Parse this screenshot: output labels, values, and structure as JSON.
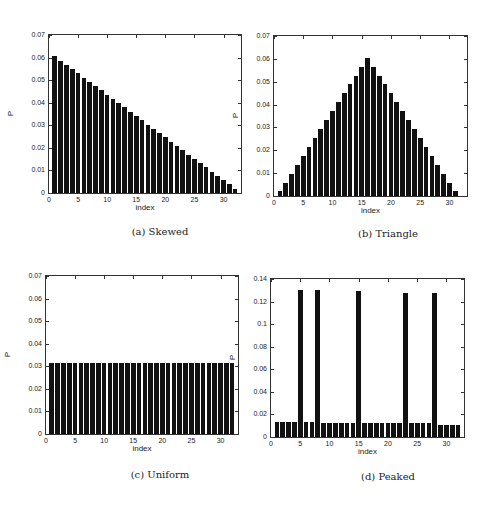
{
  "chart_data": [
    {
      "type": "bar",
      "id": "a",
      "caption": "(a) Skewed",
      "xlabel": "index",
      "ylabel": "P",
      "xlim": [
        0,
        33
      ],
      "ylim": [
        0,
        0.07
      ],
      "xticks": [
        0,
        5,
        10,
        15,
        20,
        25,
        30
      ],
      "yticks": [
        0,
        0.01,
        0.02,
        0.03,
        0.04,
        0.05,
        0.06,
        0.07
      ],
      "ytick_labels": [
        "0",
        "0.01",
        "0.02",
        "0.03",
        "0.04",
        "0.05",
        "0.06",
        "0.07"
      ],
      "categories": [
        1,
        2,
        3,
        4,
        5,
        6,
        7,
        8,
        9,
        10,
        11,
        12,
        13,
        14,
        15,
        16,
        17,
        18,
        19,
        20,
        21,
        22,
        23,
        24,
        25,
        26,
        27,
        28,
        29,
        30,
        31,
        32
      ],
      "values": [
        0.0606,
        0.0587,
        0.0568,
        0.0549,
        0.053,
        0.0511,
        0.0492,
        0.0473,
        0.0455,
        0.0436,
        0.0417,
        0.0398,
        0.0379,
        0.036,
        0.0341,
        0.0322,
        0.0303,
        0.0284,
        0.0265,
        0.0246,
        0.0227,
        0.0208,
        0.0189,
        0.017,
        0.0152,
        0.0133,
        0.0114,
        0.0095,
        0.0076,
        0.0057,
        0.0038,
        0.0019
      ],
      "grid": false
    },
    {
      "type": "bar",
      "id": "b",
      "caption": "(b) Triangle",
      "xlabel": "index",
      "ylabel": "P",
      "xlim": [
        0,
        33
      ],
      "ylim": [
        0,
        0.07
      ],
      "xticks": [
        0,
        5,
        10,
        15,
        20,
        25,
        30
      ],
      "yticks": [
        0,
        0.01,
        0.02,
        0.03,
        0.04,
        0.05,
        0.06,
        0.07
      ],
      "ytick_labels": [
        "0",
        "0.01",
        "0.02",
        "0.03",
        "0.04",
        "0.05",
        "0.06",
        "0.07"
      ],
      "categories": [
        1,
        2,
        3,
        4,
        5,
        6,
        7,
        8,
        9,
        10,
        11,
        12,
        13,
        14,
        15,
        16,
        17,
        18,
        19,
        20,
        21,
        22,
        23,
        24,
        25,
        26,
        27,
        28,
        29,
        30,
        31
      ],
      "values": [
        0.002,
        0.0059,
        0.0098,
        0.0137,
        0.0176,
        0.0215,
        0.0254,
        0.0293,
        0.0332,
        0.0371,
        0.041,
        0.0449,
        0.0488,
        0.0527,
        0.0566,
        0.0605,
        0.0566,
        0.0527,
        0.0488,
        0.0449,
        0.041,
        0.0371,
        0.0332,
        0.0293,
        0.0254,
        0.0215,
        0.0176,
        0.0137,
        0.0098,
        0.0059,
        0.002
      ],
      "grid": false
    },
    {
      "type": "bar",
      "id": "c",
      "caption": "(c) Uniform",
      "xlabel": "index",
      "ylabel": "P",
      "xlim": [
        0,
        33
      ],
      "ylim": [
        0,
        0.07
      ],
      "xticks": [
        0,
        5,
        10,
        15,
        20,
        25,
        30
      ],
      "yticks": [
        0,
        0.01,
        0.02,
        0.03,
        0.04,
        0.05,
        0.06,
        0.07
      ],
      "ytick_labels": [
        "0",
        "0.01",
        "0.02",
        "0.03",
        "0.04",
        "0.05",
        "0.06",
        "0.07"
      ],
      "categories": [
        1,
        2,
        3,
        4,
        5,
        6,
        7,
        8,
        9,
        10,
        11,
        12,
        13,
        14,
        15,
        16,
        17,
        18,
        19,
        20,
        21,
        22,
        23,
        24,
        25,
        26,
        27,
        28,
        29,
        30,
        31,
        32
      ],
      "values": [
        0.03125,
        0.03125,
        0.03125,
        0.03125,
        0.03125,
        0.03125,
        0.03125,
        0.03125,
        0.03125,
        0.03125,
        0.03125,
        0.03125,
        0.03125,
        0.03125,
        0.03125,
        0.03125,
        0.03125,
        0.03125,
        0.03125,
        0.03125,
        0.03125,
        0.03125,
        0.03125,
        0.03125,
        0.03125,
        0.03125,
        0.03125,
        0.03125,
        0.03125,
        0.03125,
        0.03125,
        0.03125
      ],
      "grid": false
    },
    {
      "type": "bar",
      "id": "d",
      "caption": "(d) Peaked",
      "xlabel": "index",
      "ylabel": "P",
      "xlim": [
        0,
        33
      ],
      "ylim": [
        0,
        0.14
      ],
      "xticks": [
        0,
        5,
        10,
        15,
        20,
        25,
        30
      ],
      "yticks": [
        0,
        0.02,
        0.04,
        0.06,
        0.08,
        0.1,
        0.12,
        0.14
      ],
      "ytick_labels": [
        "0",
        "0.02",
        "0.04",
        "0.06",
        "0.08",
        "0.1",
        "0.12",
        "0.14"
      ],
      "categories": [
        1,
        2,
        3,
        4,
        5,
        6,
        7,
        8,
        9,
        10,
        11,
        12,
        13,
        14,
        15,
        16,
        17,
        18,
        19,
        20,
        21,
        22,
        23,
        24,
        25,
        26,
        27,
        28,
        29,
        30,
        31,
        32
      ],
      "values": [
        0.013,
        0.013,
        0.013,
        0.013,
        0.13,
        0.013,
        0.013,
        0.13,
        0.012,
        0.012,
        0.012,
        0.012,
        0.012,
        0.012,
        0.129,
        0.012,
        0.012,
        0.012,
        0.012,
        0.012,
        0.012,
        0.012,
        0.128,
        0.012,
        0.012,
        0.012,
        0.012,
        0.128,
        0.011,
        0.011,
        0.011,
        0.011
      ],
      "grid": false
    }
  ],
  "layout": [
    {
      "left": 48,
      "top": 34,
      "width": 194,
      "height": 160,
      "caption_x": 60,
      "caption_y": 226
    },
    {
      "left": 273,
      "top": 35,
      "width": 195,
      "height": 162,
      "caption_x": 288,
      "caption_y": 228
    },
    {
      "left": 45,
      "top": 275,
      "width": 194,
      "height": 160,
      "caption_x": 60,
      "caption_y": 469
    },
    {
      "left": 270,
      "top": 278,
      "width": 195,
      "height": 160,
      "caption_x": 288,
      "caption_y": 471
    }
  ]
}
